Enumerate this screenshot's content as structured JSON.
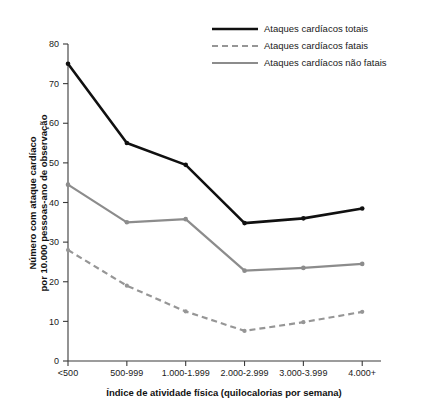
{
  "chart_data": {
    "type": "line",
    "title": "",
    "xlabel": "Índice de atividade física (quilocalorias por semana)",
    "ylabel_line1": "Número com ataque cardíaco",
    "ylabel_line2": "por 10.000 pessoas-ano de observação",
    "categories": [
      "<500",
      "500-999",
      "1.000-1.999",
      "2.000-2.999",
      "3.000-3.999",
      "4.000+"
    ],
    "ylim": [
      0,
      80
    ],
    "yticks": [
      0,
      10,
      20,
      30,
      40,
      50,
      60,
      70,
      80
    ],
    "grid": false,
    "legend_position": "top-right",
    "series": [
      {
        "name": "Ataques cardíacos totais",
        "values": [
          75,
          55,
          49.5,
          34.8,
          36,
          38.5
        ],
        "color": "#101010",
        "style": "solid",
        "width": 2.6,
        "marker": "circle"
      },
      {
        "name": "Ataques cardíacos fatais",
        "values": [
          28,
          19,
          12.5,
          7.6,
          9.8,
          12.4
        ],
        "color": "#969696",
        "style": "dashed",
        "width": 2.2,
        "marker": "circle"
      },
      {
        "name": "Ataques cardíacos não fatais",
        "values": [
          44.5,
          35,
          35.8,
          22.8,
          23.5,
          24.5
        ],
        "color": "#8c8c8c",
        "style": "solid",
        "width": 2.2,
        "marker": "circle"
      }
    ]
  },
  "axes": {
    "y_tick_labels": [
      "0",
      "10",
      "20",
      "30",
      "40",
      "50",
      "60",
      "70",
      "80"
    ],
    "x_tick_labels": [
      "<500",
      "500-999",
      "1.000-1.999",
      "2.000-2.999",
      "3.000-3.999",
      "4.000+"
    ]
  },
  "legend": {
    "items": [
      {
        "label": "Ataques cardíacos totais"
      },
      {
        "label": "Ataques cardíacos fatais"
      },
      {
        "label": "Ataques cardíacos não fatais"
      }
    ]
  }
}
